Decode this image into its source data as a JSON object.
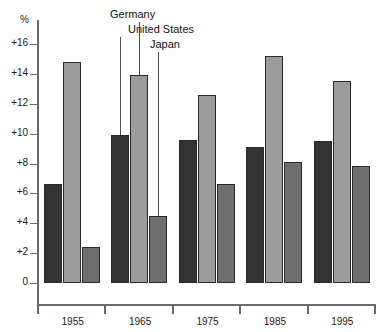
{
  "chart_data": {
    "type": "bar",
    "title": "",
    "subtitle": "",
    "xlabel": "",
    "ylabel": "%",
    "ylim": [
      0,
      17
    ],
    "grid": false,
    "legend_position": "callout-labels-above-1965-group",
    "categories": [
      "1955",
      "1965",
      "1975",
      "1985",
      "1995"
    ],
    "y_ticks": [
      "0",
      "+2",
      "+4",
      "+6",
      "+8",
      "+10",
      "+12",
      "+14",
      "+16"
    ],
    "y_tick_values": [
      0,
      2,
      4,
      6,
      8,
      10,
      12,
      14,
      16
    ],
    "series": [
      {
        "name": "United States",
        "color": "#333333",
        "values": [
          6.6,
          9.9,
          9.6,
          9.1,
          9.5
        ]
      },
      {
        "name": "Germany",
        "color": "#9c9c9c",
        "values": [
          14.8,
          13.9,
          12.6,
          15.2,
          13.5
        ]
      },
      {
        "name": "Japan",
        "color": "#6e6e6e",
        "values": [
          2.4,
          4.5,
          6.6,
          8.1,
          7.8
        ]
      }
    ],
    "annotations": [
      {
        "text": "Germany",
        "points_to_series": "Germany",
        "points_to_category": "1965"
      },
      {
        "text": "United States",
        "points_to_series": "United States",
        "points_to_category": "1965"
      },
      {
        "text": "Japan",
        "points_to_series": "Japan",
        "points_to_category": "1965"
      }
    ]
  },
  "axis": {
    "unit_label": "%"
  }
}
